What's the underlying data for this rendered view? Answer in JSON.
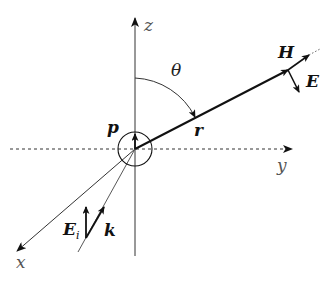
{
  "diagram": {
    "type": "dipole-scattering-geometry",
    "axes": {
      "z": {
        "label": "z"
      },
      "y": {
        "label": "y"
      },
      "x": {
        "label": "x"
      }
    },
    "angle": {
      "label": "θ"
    },
    "vectors": {
      "dipole": {
        "label": "p"
      },
      "position": {
        "label": "r"
      },
      "magnetic_field": {
        "label": "H"
      },
      "electric_field": {
        "label": "E"
      },
      "incident_field": {
        "label": "E",
        "subscript": "i"
      },
      "wave_vector": {
        "label": "k"
      }
    },
    "colors": {
      "line": "#111111",
      "axis": "#333333",
      "label": "#222222"
    }
  }
}
